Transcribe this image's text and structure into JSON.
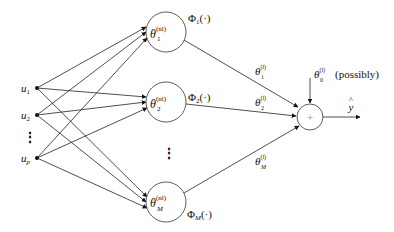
{
  "diagram": {
    "type": "neural-network",
    "inputs": [
      {
        "id": "u1",
        "base": "u",
        "sub": "1",
        "x": 37,
        "y": 88
      },
      {
        "id": "u2",
        "base": "u",
        "sub": "2",
        "x": 37,
        "y": 115
      },
      {
        "id": "up",
        "base": "u",
        "sub": "p",
        "x": 37,
        "y": 158
      }
    ],
    "input_ellipsis": "⋮",
    "hidden_nodes": [
      {
        "id": "h1",
        "theta": "θ",
        "sub": "1",
        "sup": "(nl)",
        "phi": "Φ",
        "phi_sub": "1",
        "phi_arg": "(·)",
        "x": 166,
        "y": 32
      },
      {
        "id": "h2",
        "theta": "θ",
        "sub": "2",
        "sup": "(nl)",
        "phi": "Φ",
        "phi_sub": "2",
        "phi_arg": "(·)",
        "x": 166,
        "y": 102
      },
      {
        "id": "hM",
        "theta": "θ",
        "sub": "M",
        "sup": "(nl)",
        "phi": "Φ",
        "phi_sub": "M",
        "phi_arg": "(·)",
        "x": 166,
        "y": 202
      }
    ],
    "hidden_ellipsis": "⋮",
    "output_weights": [
      {
        "theta": "θ",
        "sub": "1",
        "sup": "(l)"
      },
      {
        "theta": "θ",
        "sub": "2",
        "sup": "(l)"
      },
      {
        "theta": "θ",
        "sub": "M",
        "sup": "(l)"
      }
    ],
    "bias": {
      "theta": "θ",
      "sub": "0",
      "sup": "(l)",
      "note": "(possibly)"
    },
    "sum_node": {
      "symbol": "+",
      "x": 310,
      "y": 117
    },
    "output": {
      "label": "y",
      "hat": "^"
    }
  }
}
